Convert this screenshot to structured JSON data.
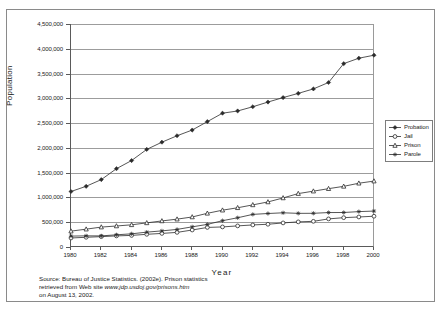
{
  "figure": {
    "ylabel": "Population",
    "xlabel": "Year"
  },
  "source_note": {
    "line1": "Source: Bureau of Justice Statistics. (2002e). Prison statistics",
    "line2_pre": "retrieved from Web site ",
    "line2_url": "www.jdp.usdoj.gov/prisons.htm",
    "line3": "on August 13, 2002."
  },
  "legend": {
    "items": [
      {
        "label": "Probation",
        "marker": "diamond"
      },
      {
        "label": "Jail",
        "marker": "circle"
      },
      {
        "label": "Prison",
        "marker": "triangle"
      },
      {
        "label": "Parole",
        "marker": "asterisk"
      }
    ]
  },
  "chart_data": {
    "type": "line",
    "title": "",
    "xlabel": "Year",
    "ylabel": "Population",
    "xlim": [
      1980,
      2000
    ],
    "ylim": [
      0,
      4500000
    ],
    "ytick_step": 500000,
    "ytick_labels": [
      "0",
      "500,000",
      "1,000,000",
      "1,500,000",
      "2,000,000",
      "2,500,000",
      "3,000,000",
      "3,500,000",
      "4,000,000",
      "4,500,000"
    ],
    "xtick_labels": [
      "1980",
      "1982",
      "1984",
      "1986",
      "1988",
      "1990",
      "1992",
      "1994",
      "1996",
      "1998",
      "2000"
    ],
    "xtick_step": 2,
    "grid": true,
    "legend_position": "right",
    "x": [
      1980,
      1981,
      1982,
      1983,
      1984,
      1985,
      1986,
      1987,
      1988,
      1989,
      1990,
      1991,
      1992,
      1993,
      1994,
      1995,
      1996,
      1997,
      1998,
      1999,
      2000
    ],
    "series": [
      {
        "name": "Probation",
        "marker": "diamond",
        "values": [
          1120000,
          1225000,
          1360000,
          1580000,
          1745000,
          1970000,
          2115000,
          2245000,
          2360000,
          2530000,
          2700000,
          2745000,
          2830000,
          2925000,
          3015000,
          3100000,
          3190000,
          3320000,
          3700000,
          3810000,
          3870000
        ]
      },
      {
        "name": "Jail",
        "marker": "circle",
        "values": [
          182000,
          196000,
          209000,
          224000,
          234000,
          256000,
          274000,
          295000,
          343000,
          395000,
          405000,
          426000,
          445000,
          459000,
          486000,
          507000,
          518000,
          567000,
          592000,
          606000,
          621000
        ]
      },
      {
        "name": "Prison",
        "marker": "triangle",
        "values": [
          320000,
          360000,
          402000,
          424000,
          448000,
          487000,
          526000,
          562000,
          606000,
          680000,
          743000,
          792000,
          850000,
          909000,
          990000,
          1078000,
          1127000,
          1177000,
          1224000,
          1287000,
          1330000
        ]
      },
      {
        "name": "Parole",
        "marker": "asterisk",
        "values": [
          220000,
          225000,
          224000,
          246000,
          266000,
          300000,
          325000,
          355000,
          407000,
          456000,
          531000,
          590000,
          658000,
          676000,
          690000,
          679000,
          680000,
          695000,
          696000,
          714000,
          725000
        ]
      }
    ]
  }
}
